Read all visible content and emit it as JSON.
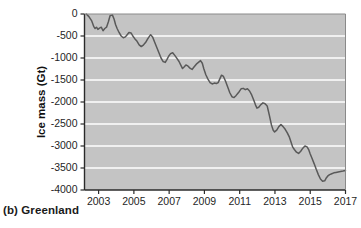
{
  "figure": {
    "caption": "(b) Greenland",
    "panel_letter": "(b)",
    "region": "Greenland"
  },
  "colors": {
    "plot_background": "#c4c4c4",
    "gridline": "#ffffff",
    "data_line": "#595959",
    "axis": "#2b2b2b",
    "text": "#1a1a1a",
    "page_background": "#ffffff"
  },
  "chart_data": {
    "type": "line",
    "title": "",
    "subtitle": "",
    "xlabel": "",
    "ylabel": "Ice mass (Gt)",
    "xlim": [
      2002.2,
      2017.0
    ],
    "ylim": [
      -4000,
      0
    ],
    "grid": true,
    "grid_axis": "y",
    "legend": false,
    "legend_position": "none",
    "xticks": [
      2003,
      2005,
      2007,
      2009,
      2011,
      2013,
      2015,
      2017
    ],
    "xtick_labels": [
      "2003",
      "2005",
      "2007",
      "2009",
      "2011",
      "2013",
      "2015",
      "2017"
    ],
    "yticks": [
      0,
      -500,
      -1000,
      -1500,
      -2000,
      -2500,
      -3000,
      -3500,
      -4000
    ],
    "ytick_labels": [
      "0",
      "-500",
      "-1000",
      "-1500",
      "-2000",
      "-2500",
      "-3000",
      "-3500",
      "-4000"
    ],
    "units": "Gt",
    "series": [
      {
        "name": "Greenland ice mass",
        "x": [
          2002.3,
          2002.45,
          2002.6,
          2002.72,
          2002.8,
          2002.88,
          2002.96,
          2003.05,
          2003.15,
          2003.25,
          2003.35,
          2003.45,
          2003.55,
          2003.65,
          2003.78,
          2003.88,
          2003.96,
          2004.05,
          2004.16,
          2004.28,
          2004.4,
          2004.52,
          2004.62,
          2004.72,
          2004.84,
          2004.94,
          2005.05,
          2005.18,
          2005.3,
          2005.42,
          2005.55,
          2005.66,
          2005.76,
          2005.86,
          2005.95,
          2006.06,
          2006.18,
          2006.3,
          2006.42,
          2006.54,
          2006.66,
          2006.78,
          2006.88,
          2006.97,
          2007.08,
          2007.2,
          2007.32,
          2007.44,
          2007.56,
          2007.66,
          2007.76,
          2007.86,
          2007.95,
          2008.06,
          2008.18,
          2008.3,
          2008.42,
          2008.54,
          2008.66,
          2008.78,
          2008.88,
          2008.97,
          2009.08,
          2009.2,
          2009.32,
          2009.44,
          2009.56,
          2009.68,
          2009.78,
          2009.88,
          2009.97,
          2010.08,
          2010.2,
          2010.32,
          2010.44,
          2010.56,
          2010.68,
          2010.8,
          2010.9,
          2010.98,
          2011.08,
          2011.2,
          2011.32,
          2011.44,
          2011.56,
          2011.68,
          2011.8,
          2011.9,
          2011.98,
          2012.08,
          2012.2,
          2012.32,
          2012.44,
          2012.56,
          2012.68,
          2012.8,
          2012.9,
          2012.98,
          2013.1,
          2013.22,
          2013.34,
          2013.46,
          2013.58,
          2013.7,
          2013.82,
          2013.92,
          2014.0,
          2014.1,
          2014.22,
          2014.34,
          2014.46,
          2014.58,
          2014.7,
          2014.82,
          2014.92,
          2015.0,
          2015.1,
          2015.22,
          2015.34,
          2015.46,
          2015.58,
          2015.7,
          2015.82,
          2015.92,
          2016.0,
          2016.1,
          2016.22,
          2016.34,
          2016.46,
          2016.58,
          2016.72,
          2016.86,
          2017.0
        ],
        "values": [
          0,
          -60,
          -150,
          -280,
          -330,
          -300,
          -350,
          -320,
          -300,
          -380,
          -330,
          -300,
          -180,
          -40,
          -20,
          -120,
          -240,
          -330,
          -420,
          -500,
          -540,
          -520,
          -470,
          -420,
          -430,
          -500,
          -560,
          -620,
          -700,
          -740,
          -700,
          -650,
          -580,
          -520,
          -470,
          -520,
          -640,
          -760,
          -880,
          -1000,
          -1080,
          -1100,
          -1030,
          -960,
          -900,
          -880,
          -940,
          -1010,
          -1080,
          -1160,
          -1240,
          -1200,
          -1160,
          -1180,
          -1230,
          -1260,
          -1200,
          -1140,
          -1100,
          -1060,
          -1120,
          -1250,
          -1380,
          -1480,
          -1560,
          -1590,
          -1570,
          -1580,
          -1560,
          -1470,
          -1390,
          -1420,
          -1530,
          -1660,
          -1790,
          -1880,
          -1900,
          -1850,
          -1800,
          -1760,
          -1700,
          -1690,
          -1720,
          -1700,
          -1750,
          -1840,
          -1960,
          -2070,
          -2140,
          -2120,
          -2060,
          -2020,
          -2040,
          -2090,
          -2300,
          -2520,
          -2640,
          -2680,
          -2640,
          -2560,
          -2510,
          -2560,
          -2620,
          -2700,
          -2800,
          -2920,
          -3020,
          -3080,
          -3140,
          -3170,
          -3120,
          -3050,
          -3000,
          -3020,
          -3090,
          -3180,
          -3280,
          -3400,
          -3530,
          -3650,
          -3750,
          -3800,
          -3790,
          -3720,
          -3680,
          -3650,
          -3630,
          -3610,
          -3600,
          -3590,
          -3580,
          -3570,
          -3555
        ]
      }
    ],
    "annotations": []
  }
}
